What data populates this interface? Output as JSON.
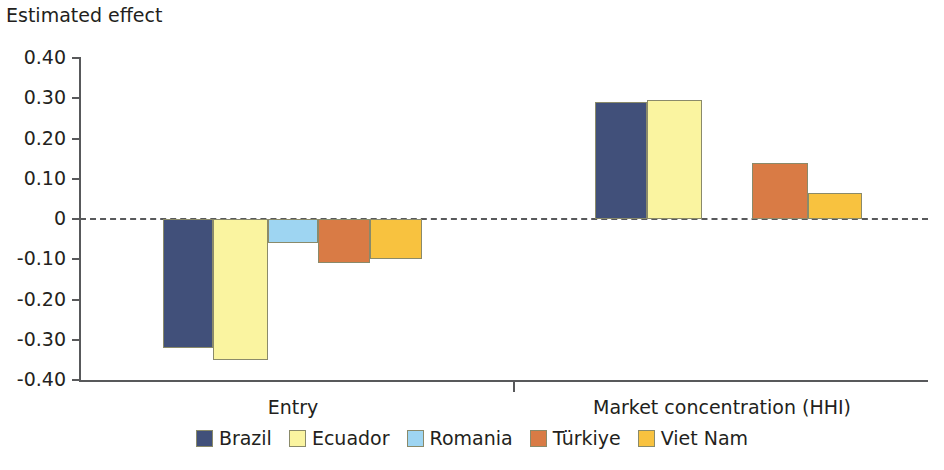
{
  "chart_data": {
    "type": "bar",
    "title": "Estimated effect",
    "subtitle": "",
    "xlabel": "",
    "ylabel": "Estimated effect",
    "categories": [
      "Entry",
      "Market concentration (HHI)"
    ],
    "series": [
      {
        "name": "Brazil",
        "color": "#41507a",
        "values": [
          -0.32,
          0.29
        ]
      },
      {
        "name": "Ecuador",
        "color": "#faf4a0",
        "values": [
          -0.35,
          0.295
        ]
      },
      {
        "name": "Romania",
        "color": "#9ed5f2",
        "values": [
          -0.06,
          null
        ]
      },
      {
        "name": "Türkiye",
        "color": "#d97b45",
        "values": [
          -0.11,
          0.14
        ]
      },
      {
        "name": "Viet Nam",
        "color": "#f8c23f",
        "values": [
          -0.1,
          0.065
        ]
      }
    ],
    "ylim": [
      -0.4,
      0.4
    ],
    "yticks": [
      "0.40",
      "0.30",
      "0.20",
      "0.10",
      "0",
      "-0.10",
      "-0.20",
      "-0.30",
      "-0.40"
    ],
    "ytick_values": [
      0.4,
      0.3,
      0.2,
      0.1,
      0,
      -0.1,
      -0.2,
      -0.3,
      -0.4
    ],
    "grid": false,
    "zero_line": "dashed",
    "legend_position": "bottom"
  },
  "legend": {
    "items": [
      {
        "label": "Brazil",
        "color": "#41507a"
      },
      {
        "label": "Ecuador",
        "color": "#faf4a0"
      },
      {
        "label": "Romania",
        "color": "#9ed5f2"
      },
      {
        "label": "Türkiye",
        "color": "#d97b45"
      },
      {
        "label": "Viet Nam",
        "color": "#f8c23f"
      }
    ]
  },
  "bars": [
    {
      "name": "entry-brazil",
      "x": 163,
      "w": 50,
      "value": -0.32,
      "color": "#41507a"
    },
    {
      "name": "entry-ecuador",
      "x": 213,
      "w": 55,
      "value": -0.35,
      "color": "#faf4a0"
    },
    {
      "name": "entry-romania",
      "x": 268,
      "w": 50,
      "value": -0.06,
      "color": "#9ed5f2"
    },
    {
      "name": "entry-turkiye",
      "x": 318,
      "w": 52,
      "value": -0.11,
      "color": "#d97b45"
    },
    {
      "name": "entry-vietnam",
      "x": 370,
      "w": 52,
      "value": -0.1,
      "color": "#f8c23f"
    },
    {
      "name": "hhi-brazil",
      "x": 595,
      "w": 52,
      "value": 0.29,
      "color": "#41507a"
    },
    {
      "name": "hhi-ecuador",
      "x": 647,
      "w": 55,
      "value": 0.295,
      "color": "#faf4a0"
    },
    {
      "name": "hhi-turkiye",
      "x": 752,
      "w": 56,
      "value": 0.14,
      "color": "#d97b45"
    },
    {
      "name": "hhi-vietnam",
      "x": 808,
      "w": 54,
      "value": 0.065,
      "color": "#f8c23f"
    }
  ],
  "category_labels": [
    {
      "label": "Entry",
      "center": 293
    },
    {
      "label": "Market concentration (HHI)",
      "center": 722
    }
  ]
}
